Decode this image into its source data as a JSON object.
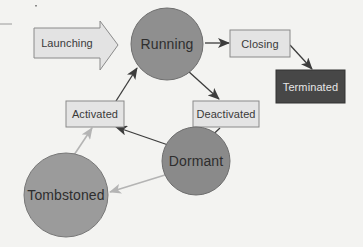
{
  "diagram": {
    "nodes": {
      "launching": {
        "label": "Launching",
        "shape": "block-arrow",
        "fill": "#e3e3e3",
        "stroke": "#8a8a8a"
      },
      "running": {
        "label": "Running",
        "shape": "circle",
        "fill": "#8f8f8f",
        "stroke": "#6e6e6e"
      },
      "closing": {
        "label": "Closing",
        "shape": "box",
        "fill": "#e4e4e4",
        "stroke": "#8a8a8a"
      },
      "terminated": {
        "label": "Terminated",
        "shape": "box",
        "fill": "#474747",
        "stroke": "#333333"
      },
      "deactivated": {
        "label": "Deactivated",
        "shape": "box",
        "fill": "#e4e4e4",
        "stroke": "#8a8a8a"
      },
      "activated": {
        "label": "Activated",
        "shape": "box",
        "fill": "#e4e4e4",
        "stroke": "#8a8a8a"
      },
      "dormant": {
        "label": "Dormant",
        "shape": "circle",
        "fill": "#8a8a8a",
        "stroke": "#6e6e6e"
      },
      "tombstoned": {
        "label": "Tombstoned",
        "shape": "circle",
        "fill": "#9b9b9b",
        "stroke": "#777777"
      }
    },
    "edges": [
      {
        "from": "launching",
        "to": "running",
        "style": "block-arrow"
      },
      {
        "from": "running",
        "to": "closing",
        "style": "dark"
      },
      {
        "from": "closing",
        "to": "terminated",
        "style": "dark"
      },
      {
        "from": "running",
        "to": "deactivated",
        "style": "dark"
      },
      {
        "from": "deactivated",
        "to": "dormant",
        "style": "dark"
      },
      {
        "from": "dormant",
        "to": "activated",
        "style": "dark"
      },
      {
        "from": "activated",
        "to": "running",
        "style": "dark"
      },
      {
        "from": "dormant",
        "to": "tombstoned",
        "style": "light"
      },
      {
        "from": "tombstoned",
        "to": "activated",
        "style": "light"
      }
    ],
    "colors": {
      "background": "#f3f3f1",
      "edge_dark": "#3c3c3c",
      "edge_light": "#b4b4b4"
    }
  }
}
